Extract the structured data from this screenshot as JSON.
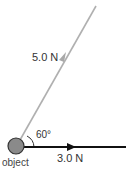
{
  "diagram": {
    "forces": [
      {
        "name": "force-a",
        "label": "5.0 N",
        "color": "#a8a8a8"
      },
      {
        "name": "force-b",
        "label": "3.0 N",
        "color": "#111111"
      }
    ],
    "angle_label": "60°",
    "object_label": "object",
    "object_color": "#8a8a8a"
  }
}
